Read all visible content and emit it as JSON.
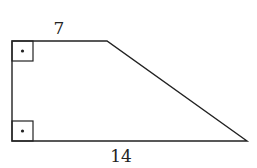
{
  "figure": {
    "shape": "right trapezoid",
    "labels": {
      "top_base": "7",
      "bottom_base": "14"
    },
    "right_angle_markers": [
      "top-left",
      "bottom-left"
    ],
    "stroke_color": "#222222"
  }
}
